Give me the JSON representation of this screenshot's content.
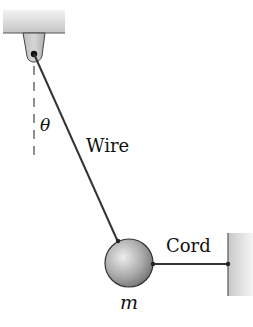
{
  "diagram": {
    "type": "physics-free-body",
    "labels": {
      "angle": "θ",
      "wire": "Wire",
      "cord": "Cord",
      "mass": "m"
    },
    "elements": {
      "ceiling_support": {
        "x": 3,
        "y": 10,
        "width": 62,
        "height": 23
      },
      "bracket_pivot": {
        "x": 34,
        "y": 54
      },
      "vertical_reference": {
        "x": 34,
        "y1": 62,
        "y2": 158,
        "style": "dashed"
      },
      "wire": {
        "from": [
          34,
          54
        ],
        "to": [
          118,
          241
        ]
      },
      "ball": {
        "cx": 129,
        "cy": 263,
        "r": 24
      },
      "cord": {
        "from": [
          153,
          264
        ],
        "to": [
          228,
          264
        ]
      },
      "wall": {
        "x": 228,
        "y": 233,
        "width": 25,
        "height": 63
      }
    },
    "colors": {
      "line": "#333333",
      "support_light": "#f0f0f0",
      "support_dark": "#b8b8b8",
      "ball_light": "#e6e6e6",
      "ball_dark": "#7a7a7a"
    }
  }
}
